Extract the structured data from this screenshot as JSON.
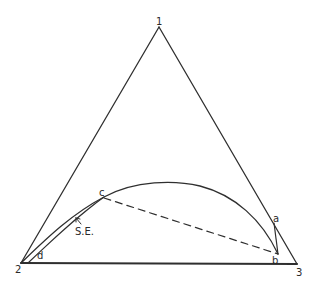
{
  "diagram": {
    "type": "ternary phase diagram",
    "vertices": [
      {
        "label": "1",
        "x": 159,
        "y": 27
      },
      {
        "label": "2",
        "x": 21,
        "y": 263
      },
      {
        "label": "3",
        "x": 297,
        "y": 264
      }
    ],
    "points": [
      {
        "label": "a",
        "x": 274,
        "y": 223
      },
      {
        "label": "b",
        "x": 278,
        "y": 254
      },
      {
        "label": "c",
        "x": 104,
        "y": 197
      },
      {
        "label": "d",
        "x": 35,
        "y": 252
      }
    ],
    "annotation": {
      "label": "S.E.",
      "arrow_target": "inner-curve"
    },
    "tie_line": {
      "from": "c",
      "to": "b",
      "style": "dashed"
    },
    "colors": {
      "line": "#2f2f2f",
      "background": "#ffffff"
    }
  },
  "labels": {
    "v1": "1",
    "v2": "2",
    "v3": "3",
    "a": "a",
    "b": "b",
    "c": "c",
    "d": "d",
    "se": "S.E."
  }
}
